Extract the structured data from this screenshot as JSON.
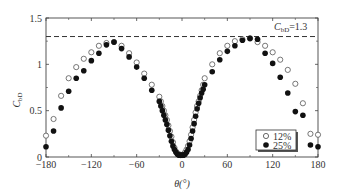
{
  "chart_data": {
    "type": "scatter",
    "title": "",
    "xlabel": "θ(°)",
    "ylabel": "C_bD",
    "xlim": [
      -180,
      180
    ],
    "ylim": [
      0,
      1.5
    ],
    "xticks": [
      -180,
      -120,
      -60,
      0,
      60,
      120,
      180
    ],
    "xtick_labels": [
      "−180",
      "−120",
      "−60",
      "0",
      "60",
      "120",
      "180"
    ],
    "yticks": [
      0,
      0.5,
      1,
      1.5
    ],
    "ytick_labels": [
      "0",
      "0.5",
      "1",
      "1.5"
    ],
    "grid": false,
    "legend_position": "lower right",
    "reference_line": {
      "y": 1.3,
      "style": "dashed",
      "label": "C_bD=1.3"
    },
    "series": [
      {
        "name": "12%",
        "marker": "open-circle",
        "x": [
          -180,
          -170,
          -160,
          -150,
          -140,
          -130,
          -120,
          -110,
          -100,
          -90,
          -80,
          -70,
          -60,
          -50,
          -40,
          -30,
          -28,
          -26,
          -24,
          -22,
          -20,
          -18,
          -16,
          -14,
          -12,
          -10,
          -8,
          -6,
          -4,
          -2,
          0,
          2,
          4,
          6,
          8,
          10,
          12,
          14,
          16,
          18,
          20,
          22,
          24,
          26,
          28,
          30,
          40,
          50,
          60,
          70,
          80,
          90,
          100,
          110,
          120,
          130,
          140,
          150,
          160,
          170,
          180
        ],
        "values": [
          0.23,
          0.41,
          0.66,
          0.85,
          0.97,
          1.06,
          1.13,
          1.2,
          1.23,
          1.24,
          1.2,
          1.12,
          1.02,
          0.9,
          0.78,
          0.65,
          0.6,
          0.55,
          0.5,
          0.45,
          0.4,
          0.34,
          0.28,
          0.22,
          0.16,
          0.1,
          0.06,
          0.04,
          0.03,
          0.02,
          0.02,
          0.03,
          0.05,
          0.08,
          0.12,
          0.17,
          0.24,
          0.32,
          0.4,
          0.48,
          0.55,
          0.6,
          0.66,
          0.72,
          0.78,
          0.85,
          1.0,
          1.12,
          1.2,
          1.25,
          1.27,
          1.28,
          1.24,
          1.2,
          1.13,
          1.05,
          0.94,
          0.79,
          0.58,
          0.25,
          0.24
        ]
      },
      {
        "name": "25%",
        "marker": "filled-circle",
        "x": [
          -180,
          -170,
          -160,
          -150,
          -140,
          -130,
          -120,
          -110,
          -100,
          -90,
          -80,
          -70,
          -60,
          -50,
          -40,
          -30,
          -28,
          -26,
          -24,
          -22,
          -20,
          -18,
          -16,
          -14,
          -12,
          -10,
          -8,
          -6,
          -4,
          -2,
          0,
          2,
          4,
          6,
          8,
          10,
          12,
          14,
          16,
          18,
          20,
          22,
          24,
          26,
          28,
          30,
          40,
          50,
          60,
          70,
          80,
          90,
          100,
          110,
          120,
          130,
          140,
          150,
          160,
          170,
          180
        ],
        "values": [
          0.11,
          0.28,
          0.53,
          0.71,
          0.85,
          0.93,
          1.04,
          1.12,
          1.21,
          1.24,
          1.17,
          1.08,
          0.97,
          0.85,
          0.72,
          0.6,
          0.55,
          0.5,
          0.45,
          0.4,
          0.35,
          0.29,
          0.23,
          0.17,
          0.12,
          0.08,
          0.05,
          0.03,
          0.02,
          0.02,
          0.02,
          0.02,
          0.03,
          0.05,
          0.08,
          0.13,
          0.2,
          0.28,
          0.36,
          0.44,
          0.52,
          0.58,
          0.64,
          0.69,
          0.73,
          0.78,
          0.92,
          1.05,
          1.14,
          1.2,
          1.26,
          1.28,
          1.27,
          1.12,
          1.01,
          0.86,
          0.69,
          0.49,
          0.45,
          0.13,
          0.11
        ]
      }
    ]
  },
  "labels": {
    "y_axis_main": "C",
    "y_axis_sub": "bD",
    "x_axis": "θ(°)",
    "ref_main": "C",
    "ref_sub": "bD",
    "ref_value": "=1.3",
    "legend": [
      "12%",
      "25%"
    ]
  }
}
